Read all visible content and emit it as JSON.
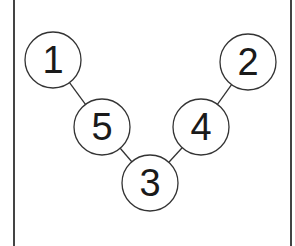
{
  "diagram": {
    "type": "tree",
    "nodes": [
      {
        "id": "1",
        "label": "1",
        "cx": 53,
        "cy": 60
      },
      {
        "id": "2",
        "label": "2",
        "cx": 248,
        "cy": 62
      },
      {
        "id": "5",
        "label": "5",
        "cx": 102,
        "cy": 127
      },
      {
        "id": "4",
        "label": "4",
        "cx": 201,
        "cy": 127
      },
      {
        "id": "3",
        "label": "3",
        "cx": 150,
        "cy": 183
      }
    ],
    "edges": [
      {
        "from": "1",
        "to": "5"
      },
      {
        "from": "5",
        "to": "3"
      },
      {
        "from": "3",
        "to": "4"
      },
      {
        "from": "4",
        "to": "2"
      }
    ],
    "node_radius": 28,
    "colors": {
      "stroke": "#333333",
      "text": "#1a1a1a",
      "background": "#ffffff"
    }
  }
}
